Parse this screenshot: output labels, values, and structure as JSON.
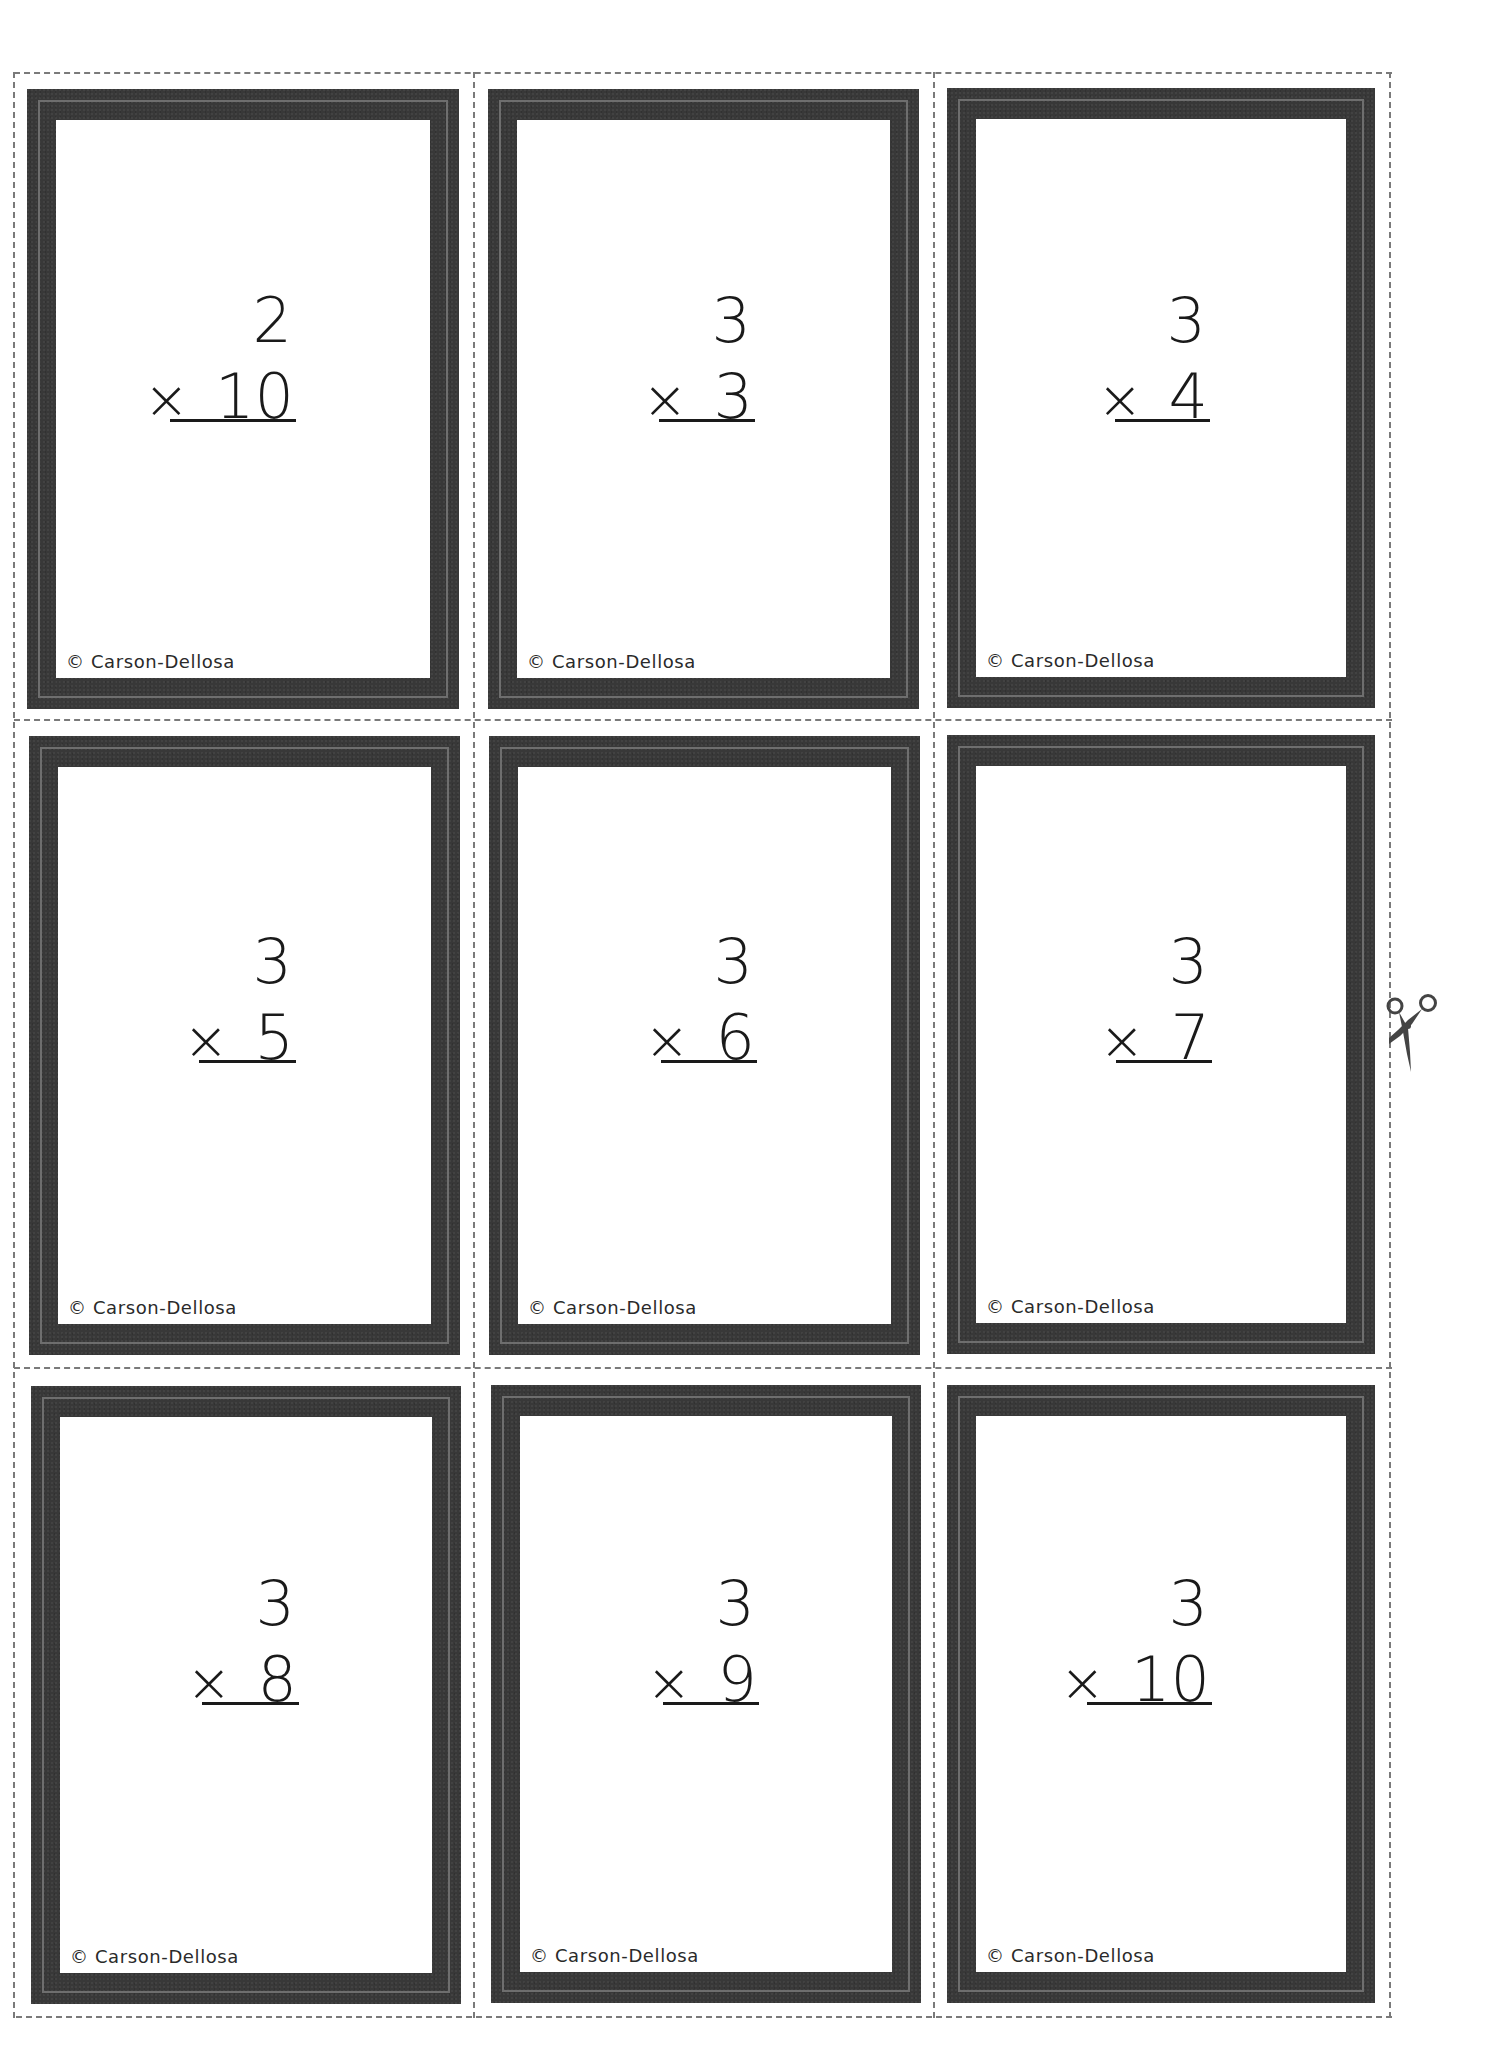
{
  "sheet": {
    "title": "Multiplication flash cards",
    "copyright": "© Carson-Dellosa",
    "frame_color": "#383838",
    "frame_line_color": "#6e6e6e",
    "cut_line_color": "#7a7a7a",
    "cut_icon": "scissors-icon"
  },
  "cards": [
    {
      "top": "2",
      "operator": "×",
      "bottom": "10",
      "copyright": "© Carson-Dellosa"
    },
    {
      "top": "3",
      "operator": "×",
      "bottom": "3",
      "copyright": "© Carson-Dellosa"
    },
    {
      "top": "3",
      "operator": "×",
      "bottom": "4",
      "copyright": "© Carson-Dellosa"
    },
    {
      "top": "3",
      "operator": "×",
      "bottom": "5",
      "copyright": "© Carson-Dellosa"
    },
    {
      "top": "3",
      "operator": "×",
      "bottom": "6",
      "copyright": "© Carson-Dellosa"
    },
    {
      "top": "3",
      "operator": "×",
      "bottom": "7",
      "copyright": "© Carson-Dellosa"
    },
    {
      "top": "3",
      "operator": "×",
      "bottom": "8",
      "copyright": "© Carson-Dellosa"
    },
    {
      "top": "3",
      "operator": "×",
      "bottom": "9",
      "copyright": "© Carson-Dellosa"
    },
    {
      "top": "3",
      "operator": "×",
      "bottom": "10",
      "copyright": "© Carson-Dellosa"
    }
  ]
}
